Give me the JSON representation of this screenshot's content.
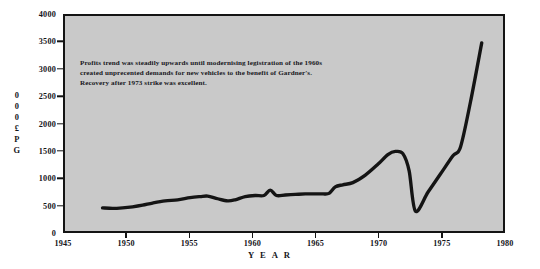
{
  "chart_data": {
    "type": "line",
    "title": "",
    "xlabel": "Y E A R",
    "ylabel": "G P £ 0 0 0",
    "ylabel_chars": [
      "G",
      "P",
      "£",
      "0",
      "0",
      "0"
    ],
    "xlim": [
      1945,
      1980
    ],
    "ylim": [
      0,
      4000
    ],
    "grid": false,
    "legend": null,
    "xticks": [
      "1945",
      "1950",
      "1955",
      "1960",
      "1965",
      "1970",
      "1975",
      "1980"
    ],
    "yticks": [
      "0",
      "500",
      "1000",
      "1500",
      "2000",
      "2500",
      "3000",
      "3500",
      "4000"
    ],
    "plot_background": "#c9c9c9",
    "line_color": "#141414",
    "axis_color": "#141414",
    "series": [
      {
        "name": "Gross Profit",
        "x": [
          1948.0,
          1948.8,
          1949.6,
          1950.4,
          1951.2,
          1952.0,
          1953.0,
          1954.0,
          1955.0,
          1955.8,
          1956.4,
          1957.2,
          1958.0,
          1958.6,
          1959.4,
          1960.2,
          1960.9,
          1961.4,
          1961.9,
          1962.6,
          1963.4,
          1964.2,
          1965.0,
          1965.6,
          1966.1,
          1966.6,
          1967.2,
          1968.0,
          1969.0,
          1970.0,
          1970.8,
          1971.4,
          1972.0,
          1972.5,
          1973.0,
          1974.0,
          1975.0,
          1976.0,
          1976.6,
          1977.4,
          1978.3
        ],
        "values": [
          430,
          420,
          430,
          450,
          480,
          520,
          560,
          580,
          620,
          640,
          650,
          600,
          560,
          580,
          640,
          660,
          660,
          760,
          660,
          670,
          680,
          690,
          690,
          690,
          700,
          820,
          860,
          900,
          1040,
          1240,
          1420,
          1480,
          1440,
          1120,
          370,
          720,
          1060,
          1400,
          1560,
          2400,
          3500
        ]
      }
    ],
    "annotation": {
      "lines": [
        "Profits trend was steadily upwards until modernising legistration of the 1960s",
        "created unprecented demands for new vehicles to the benefit of Gardner's.",
        "Recovery after 1973 strike was excellent."
      ]
    }
  }
}
